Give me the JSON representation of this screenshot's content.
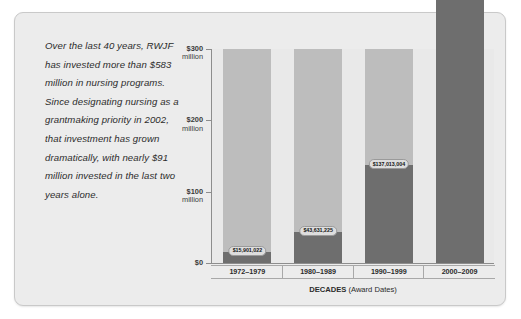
{
  "callout": {
    "text": "Over the last 40 years, RWJF has invested more than $583 million in nursing programs. Since designating nursing as a grantmaking priority in 2002, that investment has grown dramatically, with nearly $91 million invested in the last two years alone."
  },
  "colors": {
    "card_background": "#ececec",
    "plot_background": "#e9e9e9",
    "bar_track": "#bdbdbd",
    "bar_fill": "#6e6e6e",
    "axis": "#8d8d8d",
    "label_background": "#dedede",
    "text": "#2b2b2b"
  },
  "chart_data": {
    "type": "bar",
    "title": "",
    "xlabel": "DECADES (Award Dates)",
    "ylabel": "",
    "categories": [
      "1972–1979",
      "1980–1989",
      "1990–1999",
      "2000–2009"
    ],
    "values": [
      15901022,
      43631225,
      137013004,
      386382599
    ],
    "value_labels": [
      "$15,901,022",
      "$43,631,225",
      "$137,013,004",
      "$386,382,599"
    ],
    "ylim": [
      0,
      300000000
    ],
    "yticks": [
      0,
      100000000,
      200000000,
      300000000
    ],
    "ytick_labels": [
      {
        "amount": "$0",
        "unit": ""
      },
      {
        "amount": "$100",
        "unit": "million"
      },
      {
        "amount": "$200",
        "unit": "million"
      },
      {
        "amount": "$300",
        "unit": "million"
      }
    ],
    "grid": false,
    "legend": "none"
  },
  "axis_title": {
    "main": "DECADES ",
    "sub": "(Award Dates)"
  }
}
